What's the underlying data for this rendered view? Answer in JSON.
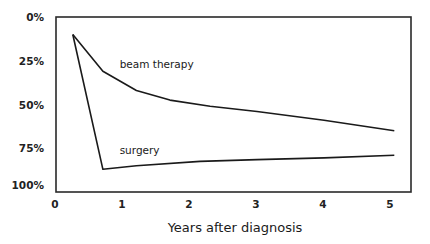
{
  "chart_data": {
    "type": "line",
    "title": "",
    "xlabel": "Years after diagnosis",
    "ylabel": "",
    "xlim": [
      0,
      5.15
    ],
    "ylim": [
      0,
      100
    ],
    "y_inverted": true,
    "grid": false,
    "legend": "inline labels",
    "x_ticks": [
      "0",
      "1",
      "2",
      "3",
      "4",
      "5"
    ],
    "y_ticks": [
      "0%",
      "25%",
      "50%",
      "75%",
      "100%"
    ],
    "series": [
      {
        "name": "beam therapy",
        "x": [
          0.25,
          0.7,
          1.2,
          1.7,
          2.3,
          3.0,
          4.0,
          5.05
        ],
        "values": [
          10,
          31,
          42,
          47.5,
          51,
          54,
          59,
          65
        ]
      },
      {
        "name": "surgery",
        "x": [
          0.25,
          0.7,
          1.2,
          2.15,
          3.0,
          4.0,
          5.05
        ],
        "values": [
          10,
          87,
          85,
          82.5,
          81.5,
          80.5,
          79
        ]
      }
    ],
    "annotations": [
      {
        "text": "beam therapy",
        "x": 0.95,
        "y": 27
      },
      {
        "text": "surgery",
        "x": 0.95,
        "y": 76
      }
    ]
  },
  "colors": {
    "line": "#1a1a1a",
    "frame": "#2a2a2a",
    "background": "#ffffff"
  }
}
